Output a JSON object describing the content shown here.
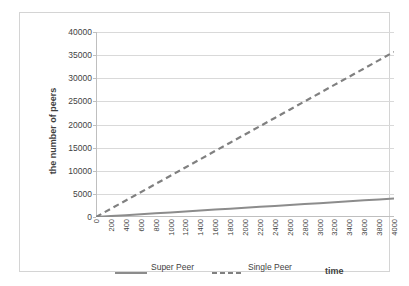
{
  "chart_data": {
    "type": "line",
    "title": "",
    "xlabel": "time",
    "ylabel": "the number of peers",
    "xlim": [
      0,
      4000
    ],
    "ylim": [
      0,
      40000
    ],
    "grid": true,
    "legend_position": "bottom",
    "x_tick_labels": [
      "0",
      "200",
      "400",
      "600",
      "800",
      "1000",
      "1200",
      "1400",
      "1600",
      "1800",
      "2000",
      "2200",
      "2400",
      "2600",
      "2800",
      "3000",
      "3200",
      "3400",
      "3600",
      "3800",
      "4000"
    ],
    "y_tick_labels": [
      "0",
      "5000",
      "10000",
      "15000",
      "20000",
      "25000",
      "30000",
      "35000",
      "40000"
    ],
    "y_ticks": [
      0,
      5000,
      10000,
      15000,
      20000,
      25000,
      30000,
      35000,
      40000
    ],
    "x": [
      0,
      200,
      400,
      600,
      800,
      1000,
      1200,
      1400,
      1600,
      1800,
      2000,
      2200,
      2400,
      2600,
      2800,
      3000,
      3200,
      3400,
      3600,
      3800,
      4000
    ],
    "series": [
      {
        "name": "Super Peer",
        "style": "solid",
        "color": "#8c8c8c",
        "values": [
          0,
          200,
          400,
          600,
          800,
          1000,
          1200,
          1400,
          1600,
          1800,
          2000,
          2200,
          2400,
          2600,
          2800,
          3000,
          3200,
          3400,
          3600,
          3800,
          4000
        ]
      },
      {
        "name": "Single Peer",
        "style": "dashed",
        "color": "#808080",
        "values": [
          0,
          1785,
          3570,
          5355,
          7140,
          8925,
          10710,
          12495,
          14280,
          16065,
          17850,
          19635,
          21420,
          23205,
          24990,
          26775,
          28560,
          30345,
          32130,
          33915,
          35700
        ]
      }
    ]
  },
  "legend": {
    "entries": [
      {
        "label": "Super Peer"
      },
      {
        "label": "Single Peer"
      }
    ]
  },
  "colors": {
    "gridline": "#d9d9d9",
    "axis": "#bfbfbf",
    "border": "#d4d4d4",
    "text": "#3f3f3f",
    "super_peer": "#8c8c8c",
    "single_peer": "#808080"
  }
}
